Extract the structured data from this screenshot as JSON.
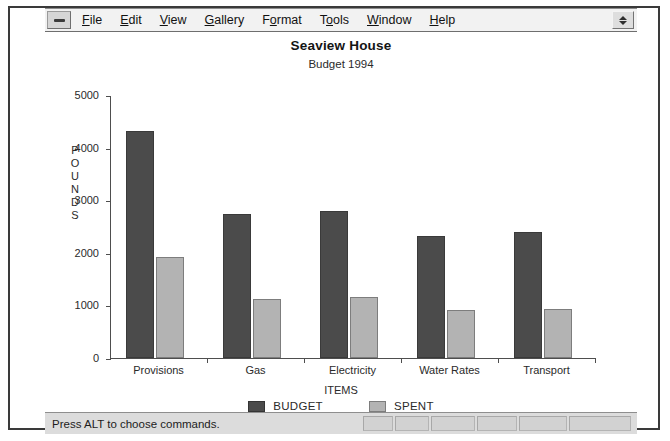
{
  "window": {
    "system_menu_icon": "minimize-dash-icon",
    "restore_icon": "up-down-arrow-icon"
  },
  "menu": {
    "items": [
      {
        "label": "File",
        "mnemonic": "F"
      },
      {
        "label": "Edit",
        "mnemonic": "E"
      },
      {
        "label": "View",
        "mnemonic": "V"
      },
      {
        "label": "Gallery",
        "mnemonic": "G"
      },
      {
        "label": "Format",
        "mnemonic": "o"
      },
      {
        "label": "Tools",
        "mnemonic": "o"
      },
      {
        "label": "Window",
        "mnemonic": "W"
      },
      {
        "label": "Help",
        "mnemonic": "H"
      }
    ]
  },
  "status": {
    "message": "Press ALT to choose commands.",
    "panels": [
      "",
      "",
      "",
      "",
      "",
      ""
    ]
  },
  "colors": {
    "budget_series": "#4b4b4b",
    "spent_series": "#b3b3b3",
    "axis": "#4e4e4e",
    "window_face": "#dcdcdc",
    "menu_face": "#f2f2f2"
  },
  "chart_data": {
    "type": "bar",
    "title": "Seaview House",
    "subtitle": "Budget 1994",
    "xlabel": "ITEMS",
    "ylabel": "POUNDS",
    "ylim": [
      0,
      5000
    ],
    "yticks": [
      0,
      1000,
      2000,
      3000,
      4000,
      5000
    ],
    "ytick_labels": [
      "0",
      "1000",
      "2000",
      "3000",
      "4000",
      "5000"
    ],
    "grid": false,
    "legend_position": "bottom-center",
    "categories": [
      "Provisions",
      "Gas",
      "Electricity",
      "Water Rates",
      "Transport"
    ],
    "series": [
      {
        "name": "BUDGET",
        "color": "#4b4b4b",
        "values": [
          4320,
          2740,
          2800,
          2320,
          2400
        ]
      },
      {
        "name": "SPENT",
        "color": "#b3b3b3",
        "values": [
          1920,
          1120,
          1160,
          910,
          930
        ]
      }
    ]
  }
}
